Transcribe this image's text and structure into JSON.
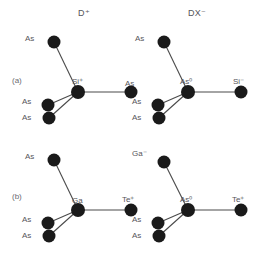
{
  "figure": {
    "background_color": "#ffffff",
    "atom_color": "#1a1a1a",
    "bond_color": "#4a4a4a",
    "text_color": "#55555a"
  },
  "columns": [
    {
      "id": "col-d-plus",
      "label": "D⁺"
    },
    {
      "id": "col-dx-minus",
      "label": "DX⁻"
    }
  ],
  "rows": [
    {
      "id": "row-a",
      "label": "(a)"
    },
    {
      "id": "row-b",
      "label": "(b)"
    }
  ],
  "panels": [
    {
      "id": "panel-a-left",
      "row": "(a)",
      "column": "D⁺",
      "center": {
        "element": "Si",
        "charge": "+",
        "label": "Si⁺"
      },
      "neighbors": [
        {
          "position": "top-left",
          "element": "As",
          "charge": "",
          "label": "As"
        },
        {
          "position": "right",
          "element": "As",
          "charge": "",
          "label": "As"
        },
        {
          "position": "lower-left-upper",
          "element": "As",
          "charge": "",
          "label": "As"
        },
        {
          "position": "lower-left-lower",
          "element": "As",
          "charge": "",
          "label": "As"
        }
      ],
      "bond_broken": false
    },
    {
      "id": "panel-a-right",
      "row": "(a)",
      "column": "DX⁻",
      "center": {
        "element": "As",
        "charge": "0",
        "label": "As⁰"
      },
      "neighbors": [
        {
          "position": "top-left",
          "element": "As",
          "charge": "",
          "label": "As"
        },
        {
          "position": "right",
          "element": "Si",
          "charge": "-",
          "label": "Si⁻"
        },
        {
          "position": "lower-left-upper",
          "element": "As",
          "charge": "",
          "label": "As"
        },
        {
          "position": "lower-left-lower",
          "element": "As",
          "charge": "",
          "label": "As"
        }
      ],
      "bond_broken": true
    },
    {
      "id": "panel-b-left",
      "row": "(b)",
      "column": "D⁺",
      "center": {
        "element": "Ga",
        "charge": "",
        "label": "Ga"
      },
      "neighbors": [
        {
          "position": "top-left",
          "element": "As",
          "charge": "",
          "label": "As"
        },
        {
          "position": "right",
          "element": "Te",
          "charge": "+",
          "label": "Te⁺"
        },
        {
          "position": "lower-left-upper",
          "element": "As",
          "charge": "",
          "label": "As"
        },
        {
          "position": "lower-left-lower",
          "element": "As",
          "charge": "",
          "label": "As"
        }
      ],
      "bond_broken": false
    },
    {
      "id": "panel-b-right",
      "row": "(b)",
      "column": "DX⁻",
      "center": {
        "element": "As",
        "charge": "0",
        "label": "As⁰"
      },
      "neighbors": [
        {
          "position": "top-left",
          "element": "Ga",
          "charge": "-",
          "label": "Ga⁻"
        },
        {
          "position": "right",
          "element": "Te",
          "charge": "+",
          "label": "Te⁺"
        },
        {
          "position": "lower-left-upper",
          "element": "As",
          "charge": "",
          "label": "As"
        },
        {
          "position": "lower-left-lower",
          "element": "As",
          "charge": "",
          "label": "As"
        }
      ],
      "bond_broken": true
    }
  ]
}
